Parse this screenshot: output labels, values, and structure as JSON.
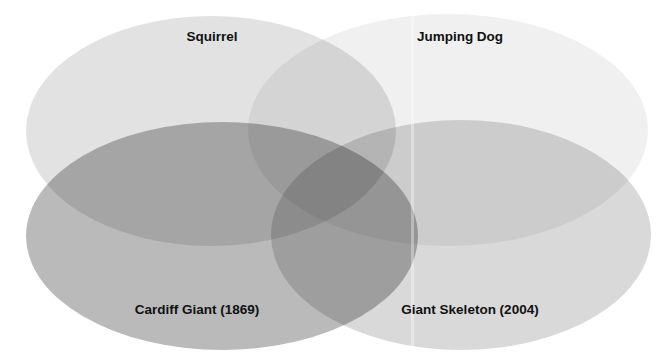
{
  "diagram": {
    "type": "venn",
    "sets": [
      {
        "id": "squirrel",
        "label": "Squirrel",
        "cx": 211,
        "cy": 131,
        "rx": 185,
        "ry": 115,
        "fill": "#000000",
        "opacity": 0.115,
        "label_x": 212,
        "label_y": 37
      },
      {
        "id": "jumping-dog",
        "label": "Jumping Dog",
        "cx": 448,
        "cy": 130,
        "rx": 200,
        "ry": 116,
        "fill": "#000000",
        "opacity": 0.06,
        "label_x": 460,
        "label_y": 37
      },
      {
        "id": "cardiff-giant",
        "label": "Cardiff Giant (1869)",
        "cx": 222,
        "cy": 236,
        "rx": 196,
        "ry": 114,
        "fill": "#000000",
        "opacity": 0.27,
        "label_x": 197,
        "label_y": 310
      },
      {
        "id": "giant-skeleton",
        "label": "Giant Skeleton (2004)",
        "cx": 461,
        "cy": 235,
        "rx": 190,
        "ry": 115,
        "fill": "#000000",
        "opacity": 0.15,
        "label_x": 470,
        "label_y": 310
      }
    ]
  }
}
